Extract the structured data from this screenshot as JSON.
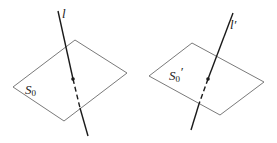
{
  "figures": [
    {
      "id": "left",
      "line_label": "l",
      "plane_label": "S",
      "plane_label_sub": "0",
      "plane_label_prime": ""
    },
    {
      "id": "right",
      "line_label": "l′",
      "plane_label": "S",
      "plane_label_sub": "0",
      "plane_label_prime": "′"
    }
  ],
  "colors": {
    "plane_stroke": "#7a7a7a",
    "line_stroke": "#1a1a1a",
    "background": "#ffffff"
  }
}
